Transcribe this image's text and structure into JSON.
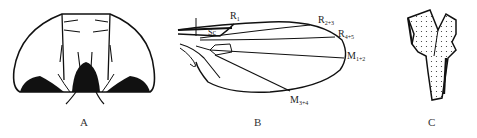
{
  "figure": {
    "panels": [
      {
        "id": "A",
        "label": "A",
        "description": "head-frontal-view"
      },
      {
        "id": "B",
        "label": "B",
        "description": "wing-venation"
      },
      {
        "id": "C",
        "label": "C",
        "description": "structure-detail"
      }
    ],
    "wing_veins": {
      "r1": {
        "main": "R",
        "sub": "1"
      },
      "sc": {
        "main": "Sc",
        "sub": ""
      },
      "r23": {
        "main": "R",
        "sub": "2+3"
      },
      "r45": {
        "main": "R",
        "sub": "4+5"
      },
      "m12": {
        "main": "M",
        "sub": "1+2"
      },
      "m34": {
        "main": "M",
        "sub": "3+4"
      }
    },
    "colors": {
      "ink": "#111111",
      "background": "#ffffff"
    }
  }
}
